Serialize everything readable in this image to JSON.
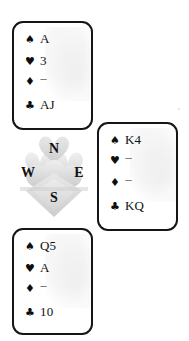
{
  "diagram": {
    "type": "bridge-hand-deal",
    "suit_symbols": {
      "spade": "♠",
      "heart": "♥",
      "diamond": "♦",
      "club": "♣"
    },
    "void_marker": "---",
    "compass": {
      "north": "N",
      "east": "E",
      "south": "S",
      "west": "W"
    },
    "hands": {
      "north": {
        "label": "North",
        "spades": "A",
        "hearts": "3",
        "diamonds": "---",
        "clubs": "AJ"
      },
      "east": {
        "label": "East",
        "spades": "K4",
        "hearts": "---",
        "diamonds": "---",
        "clubs": "KQ"
      },
      "south": {
        "label": "South",
        "spades": "Q5",
        "hearts": "A",
        "diamonds": "---",
        "clubs": "10"
      }
    },
    "colors": {
      "background": "#ffffff",
      "border": "#151515",
      "text": "#111111",
      "watermark": "#d9d9d9"
    }
  }
}
